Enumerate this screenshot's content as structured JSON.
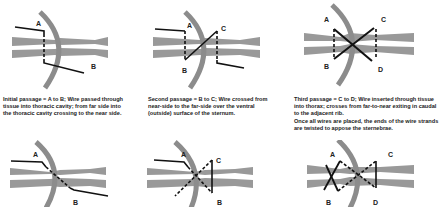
{
  "colors": {
    "bone": "#999999",
    "rib": "#8c8c8c",
    "wire": "#111111",
    "background": "#ffffff"
  },
  "panels": [
    {
      "id": "panel-1",
      "labels": {
        "a": "A",
        "b": "B"
      },
      "caption": "Initial passage = A to B; Wire passed through tissue into thoracic cavity; from far side into the thoracic cavity crossing to the near side."
    },
    {
      "id": "panel-2",
      "labels": {
        "a": "A",
        "b": "B",
        "c": "C"
      },
      "caption": "Second passage = B to C; Wire crossed from near-side to the far-side over the ventral (outside) surface of the sternum."
    },
    {
      "id": "panel-3",
      "labels": {
        "a": "A",
        "b": "B",
        "c": "C",
        "d": "D"
      },
      "caption": "Third passage = C to D; Wire inserted through tissue into thorax; crosses from far-to-near exiting in caudal to the adjacent rib.",
      "caption2": "Once all wires are placed, the ends of the wire strands are twisted to appose the sternebrae."
    },
    {
      "id": "panel-4",
      "labels": {
        "a": "A",
        "b": "B"
      }
    },
    {
      "id": "panel-5",
      "labels": {
        "a": "A",
        "b": "B",
        "c": "C"
      }
    },
    {
      "id": "panel-6",
      "labels": {
        "a": "A",
        "b": "B",
        "c": "C",
        "d": "D"
      }
    }
  ]
}
